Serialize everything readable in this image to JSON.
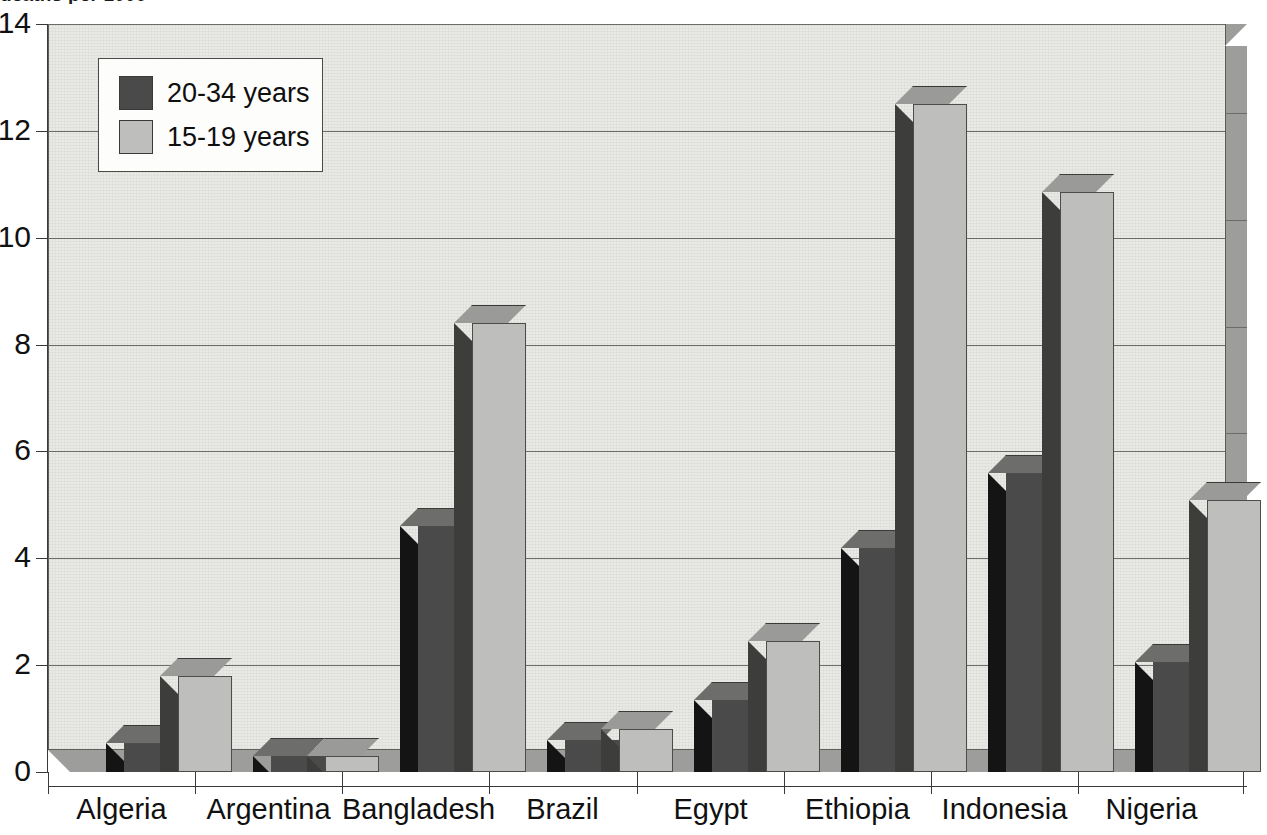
{
  "figure": {
    "clipped_title": "deaths per 1000",
    "credit": "WHO 92220"
  },
  "legend": {
    "entries": [
      {
        "label": "20-34 years",
        "color": "#4a4a4a"
      },
      {
        "label": "15-19 years",
        "color": "#bebebc"
      }
    ]
  },
  "axes": {
    "y_tick_labels": [
      "0",
      "2",
      "4",
      "6",
      "8",
      "10",
      "12",
      "14"
    ],
    "x_tick_labels": [
      "Algeria",
      "Argentina",
      "Bangladesh",
      "Brazil",
      "Egypt",
      "Ethiopia",
      "Indonesia",
      "Nigeria"
    ]
  },
  "chart_data": {
    "type": "bar",
    "title": "deaths per 1000",
    "xlabel": "",
    "ylabel": "",
    "ylim": [
      0,
      14
    ],
    "yticks": [
      0,
      2,
      4,
      6,
      8,
      10,
      12,
      14
    ],
    "grid": true,
    "legend_position": "top-left",
    "style": "3d-grouped-bar",
    "categories": [
      "Algeria",
      "Argentina",
      "Bangladesh",
      "Brazil",
      "Egypt",
      "Ethiopia",
      "Indonesia",
      "Nigeria"
    ],
    "series": [
      {
        "name": "20-34 years",
        "color": "#4a4a4a",
        "values": [
          0.55,
          0.3,
          4.6,
          0.6,
          1.35,
          4.2,
          5.6,
          2.05
        ]
      },
      {
        "name": "15-19 years",
        "color": "#bebebc",
        "values": [
          1.8,
          0.3,
          8.4,
          0.8,
          2.45,
          12.5,
          10.85,
          5.1
        ]
      }
    ]
  }
}
